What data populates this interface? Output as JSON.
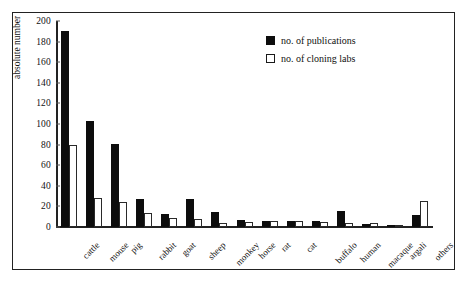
{
  "chart_data": {
    "type": "bar",
    "title": "",
    "xlabel": "",
    "ylabel": "absolute number",
    "ylim": [
      0,
      200
    ],
    "ytick_step": 20,
    "yticks": [
      0,
      20,
      40,
      60,
      80,
      100,
      120,
      140,
      160,
      180,
      200
    ],
    "grid": false,
    "legend_position": "top-right",
    "categories": [
      "cattle",
      "mouse",
      "pig",
      "rabbit",
      "goat",
      "sheep",
      "monkey",
      "horse",
      "rat",
      "cat",
      "buffalo",
      "human",
      "macaque",
      "argali",
      "others"
    ],
    "series": [
      {
        "name": "no. of publications",
        "color": "#0d0d0d",
        "values": [
          190,
          103,
          81,
          27,
          13,
          27,
          15,
          7,
          6,
          6,
          6,
          16,
          3,
          2,
          12
        ]
      },
      {
        "name": "no. of cloning labs",
        "color": "#ffffff",
        "values": [
          80,
          28,
          24,
          14,
          9,
          8,
          4,
          5,
          6,
          6,
          5,
          4,
          4,
          1,
          25
        ]
      }
    ]
  },
  "legend": {
    "entries": [
      {
        "label": "no. of publications",
        "swatch": "filled-black-square"
      },
      {
        "label": "no. of cloning labs",
        "swatch": "open-white-square"
      }
    ]
  },
  "axis": {
    "y_label": "absolute number",
    "y_tick_labels": [
      "0",
      "20",
      "40",
      "60",
      "80",
      "100",
      "120",
      "140",
      "160",
      "180",
      "200"
    ]
  },
  "colors": {
    "publications": "#0d0d0d",
    "cloning_labs": "#ffffff",
    "axis": "#222222",
    "frame": "#222222",
    "background": "#ffffff"
  }
}
